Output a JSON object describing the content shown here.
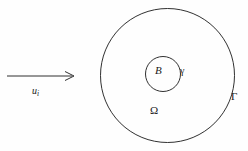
{
  "figure": {
    "type": "geometry-diagram",
    "background_color": "#fefefe",
    "stroke_color": "#1a1a1a",
    "labels": {
      "inner_domain": "B",
      "inner_boundary": "γ",
      "annulus_domain": "Ω",
      "outer_boundary": "Γ",
      "incident_field_u": "u",
      "incident_field_subscript": "i"
    },
    "shapes": {
      "outer_circle": {
        "cx": 167.5,
        "cy": 75.5,
        "r": 67,
        "fill": "none",
        "stroke_width": 0.9
      },
      "inner_circle": {
        "cx": 163,
        "cy": 74,
        "r": 17.5,
        "fill": "none",
        "stroke_width": 0.9
      },
      "arrow": {
        "x1": 7,
        "y1": 76,
        "x2": 74,
        "y2": 76,
        "stroke_width": 0.9
      }
    }
  }
}
